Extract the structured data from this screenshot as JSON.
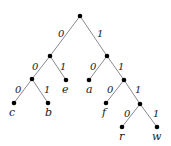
{
  "diagram": {
    "type": "binary-code-tree",
    "nodes": [
      {
        "id": "root",
        "x": 80,
        "y": 16,
        "label": ""
      },
      {
        "id": "n0",
        "x": 50,
        "y": 56,
        "label": ""
      },
      {
        "id": "n1",
        "x": 107,
        "y": 56,
        "label": ""
      },
      {
        "id": "n00",
        "x": 32,
        "y": 79,
        "label": ""
      },
      {
        "id": "e",
        "x": 66,
        "y": 80,
        "label": "e"
      },
      {
        "id": "a",
        "x": 89,
        "y": 80,
        "label": "a"
      },
      {
        "id": "n11",
        "x": 124,
        "y": 80,
        "label": ""
      },
      {
        "id": "c",
        "x": 14,
        "y": 103,
        "label": "c"
      },
      {
        "id": "b",
        "x": 48,
        "y": 103,
        "label": "b"
      },
      {
        "id": "f",
        "x": 106,
        "y": 103,
        "label": "f"
      },
      {
        "id": "n111",
        "x": 140,
        "y": 104,
        "label": ""
      },
      {
        "id": "r",
        "x": 122,
        "y": 127,
        "label": "r"
      },
      {
        "id": "w",
        "x": 157,
        "y": 127,
        "label": "w"
      }
    ],
    "edges": [
      {
        "from": "root",
        "to": "n0",
        "bit": "0"
      },
      {
        "from": "root",
        "to": "n1",
        "bit": "1"
      },
      {
        "from": "n0",
        "to": "n00",
        "bit": "0"
      },
      {
        "from": "n0",
        "to": "e",
        "bit": "1"
      },
      {
        "from": "n1",
        "to": "a",
        "bit": "0"
      },
      {
        "from": "n1",
        "to": "n11",
        "bit": "1"
      },
      {
        "from": "n00",
        "to": "c",
        "bit": "0"
      },
      {
        "from": "n00",
        "to": "b",
        "bit": "1"
      },
      {
        "from": "n11",
        "to": "f",
        "bit": "0"
      },
      {
        "from": "n11",
        "to": "n111",
        "bit": "1"
      },
      {
        "from": "n111",
        "to": "r",
        "bit": "0"
      },
      {
        "from": "n111",
        "to": "w",
        "bit": "1"
      }
    ],
    "leaf_labels": {
      "c": "c",
      "b": "b",
      "e": "e",
      "a": "a",
      "f": "f",
      "r": "r",
      "w": "w"
    },
    "edge_labels": {
      "root_n0": "0",
      "root_n1": "1",
      "n0_n00": "0",
      "n0_e": "1",
      "n1_a": "0",
      "n1_n11": "1",
      "n00_c": "0",
      "n00_b": "1",
      "n11_f": "0",
      "n11_n111": "1",
      "n111_r": "0",
      "n111_w": "1"
    }
  }
}
